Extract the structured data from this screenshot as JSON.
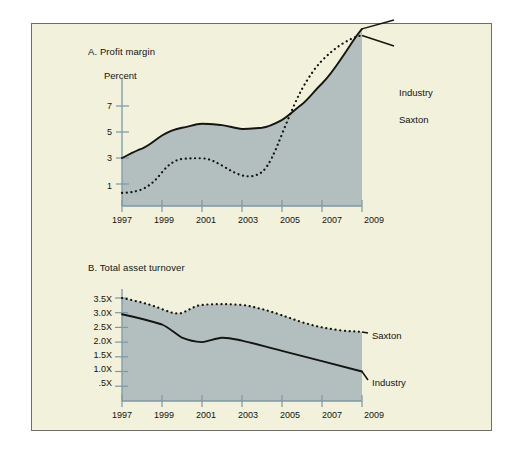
{
  "figure": {
    "background_color": "#f1f1dc",
    "page_color": "#ffffff",
    "border_color": "#6e6e66",
    "area_fill_color": "#b3bfbf",
    "axis_color": "#7a99a8",
    "line_color": "#15150f"
  },
  "chart_data": [
    {
      "type": "line",
      "title": "A. Profit margin",
      "ylabel": "Percent",
      "xlabel": "",
      "grid": false,
      "legend_position": "right-inline",
      "xlim": [
        1997,
        2009
      ],
      "ylim": [
        0,
        8.6
      ],
      "yticks": [
        1,
        3,
        5,
        7
      ],
      "ytick_labels": [
        "1",
        "3",
        "5",
        "7"
      ],
      "xticks": [
        1997,
        1999,
        2001,
        2003,
        2005,
        2007,
        2009
      ],
      "xtick_labels": [
        "1997",
        "1999",
        "2001",
        "2003",
        "2005",
        "2007",
        "2009"
      ],
      "x": [
        1997,
        1998,
        1999,
        2000,
        2001,
        2002,
        2003,
        2004,
        2005,
        2006,
        2007,
        2008,
        2009
      ],
      "series": [
        {
          "name": "Industry",
          "style": "solid",
          "filled": true,
          "values": [
            2.9,
            3.3,
            3.8,
            4.1,
            4.25,
            4.2,
            4.05,
            4.1,
            4.4,
            5.0,
            5.8,
            6.8,
            7.9
          ]
        },
        {
          "name": "Saxton",
          "style": "dashed",
          "filled": false,
          "values": [
            0.7,
            0.75,
            1.3,
            2.4,
            2.9,
            2.95,
            2.5,
            1.9,
            1.85,
            2.4,
            5.2,
            6.6,
            7.4
          ]
        }
      ],
      "annotations": [
        {
          "text": "Industry",
          "series": "Industry"
        },
        {
          "text": "Saxton",
          "series": "Saxton"
        }
      ]
    },
    {
      "type": "line",
      "title": "B. Total asset turnover",
      "ylabel": "",
      "xlabel": "",
      "grid": false,
      "legend_position": "right-inline",
      "xlim": [
        1997,
        2009
      ],
      "ylim": [
        0,
        3.85
      ],
      "yticks": [
        0.5,
        1.0,
        1.5,
        2.0,
        2.5,
        3.0,
        3.5
      ],
      "ytick_labels": [
        ".5X",
        "1.0X",
        "1.5X",
        "2.0X",
        "2.5X",
        "3.0X",
        "3.5X"
      ],
      "xticks": [
        1997,
        1999,
        2001,
        2003,
        2005,
        2007,
        2009
      ],
      "xtick_labels": [
        "1997",
        "1999",
        "2001",
        "2003",
        "2005",
        "2007",
        "2009"
      ],
      "x": [
        1997,
        1998,
        1999,
        2000,
        2001,
        2002,
        2003,
        2004,
        2005,
        2006,
        2007,
        2008,
        2009
      ],
      "series": [
        {
          "name": "Saxton",
          "style": "dashed",
          "filled": true,
          "values": [
            3.5,
            3.4,
            3.25,
            3.05,
            3.2,
            3.22,
            3.2,
            3.05,
            2.8,
            2.65,
            2.55,
            2.52,
            2.5
          ]
        },
        {
          "name": "Industry",
          "style": "solid",
          "filled": false,
          "values": [
            2.95,
            2.85,
            2.7,
            2.35,
            2.15,
            2.3,
            2.2,
            2.0,
            1.8,
            1.6,
            1.4,
            1.22,
            1.1
          ]
        }
      ],
      "annotations": [
        {
          "text": "Saxton",
          "series": "Saxton"
        },
        {
          "text": "Industry",
          "series": "Industry"
        }
      ]
    }
  ]
}
